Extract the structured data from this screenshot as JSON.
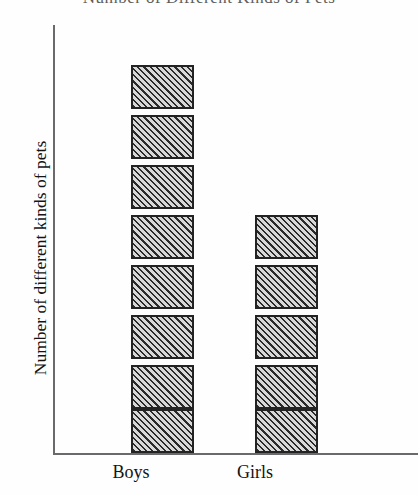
{
  "title_remnant": "Number of Different Kinds of Pets",
  "axis": {
    "y_label": "Number of different kinds of pets",
    "x_labels": [
      "Boys",
      "Girls"
    ]
  },
  "colors": {
    "background": "#fefefe",
    "axis_line": "#6a6a6c",
    "block_border": "#232323",
    "block_fill_light": "#d8d8d8",
    "block_fill_dark": "#2a2a2a",
    "text": "#141414"
  },
  "chart_data": {
    "type": "bar",
    "title": "Number of Different Kinds of Pets",
    "subtitle": "",
    "xlabel": "",
    "ylabel": "Number of different kinds of pets",
    "categories": [
      "Boys",
      "Girls"
    ],
    "values": [
      8,
      5
    ],
    "ylim": [
      0,
      9
    ],
    "grid": false,
    "legend": null,
    "unit_note": "Each bar is drawn as a stack of identical hatched unit blocks; one block equals one unit on the y-axis.",
    "blocks_per_category": {
      "Boys": 8,
      "Girls": 5
    },
    "annotations": []
  }
}
